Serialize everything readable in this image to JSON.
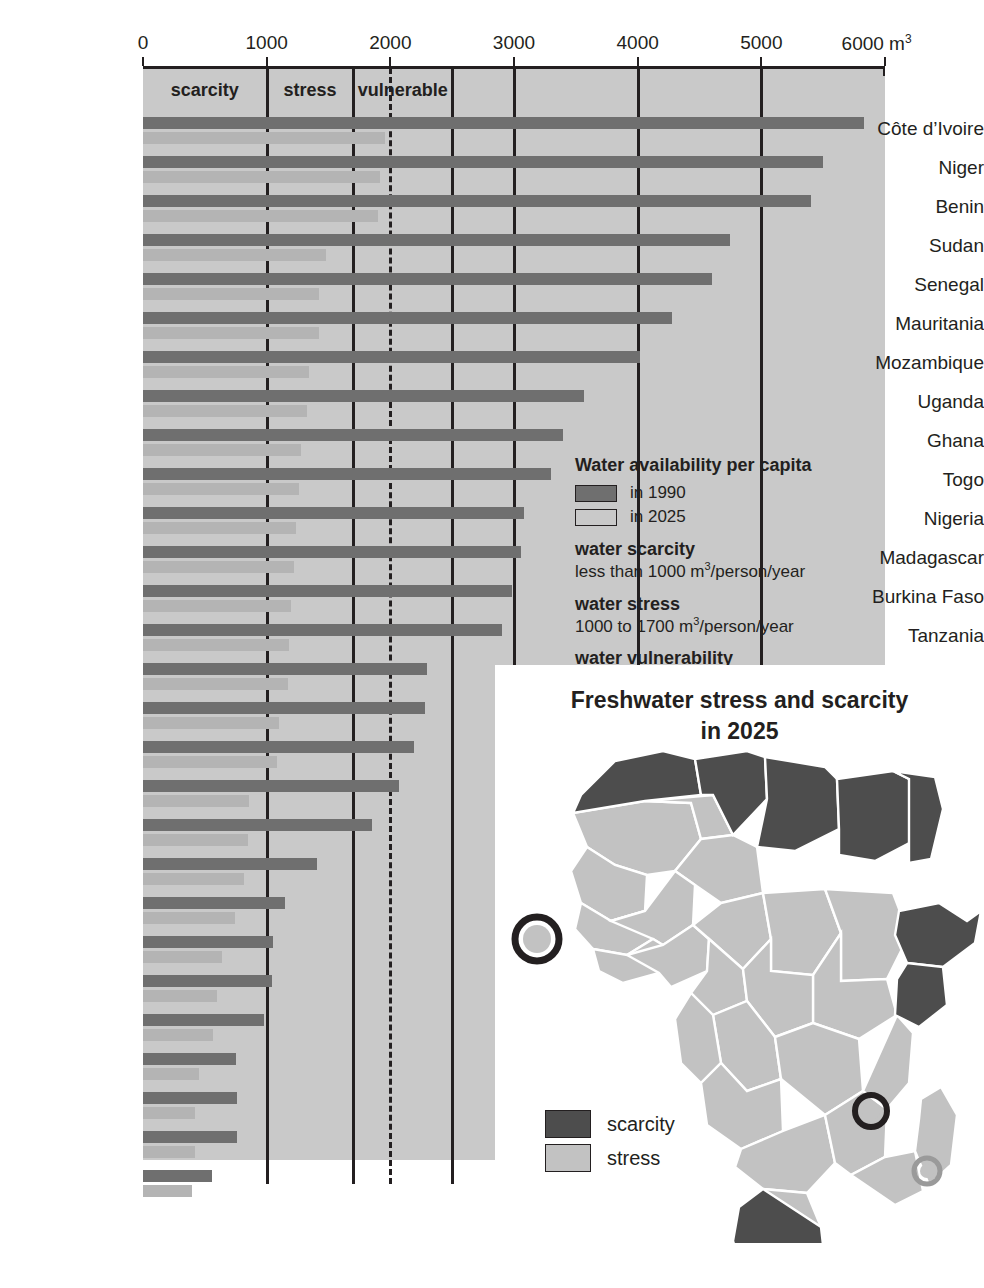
{
  "axis": {
    "ticks": [
      0,
      1000,
      2000,
      3000,
      4000,
      5000,
      6000
    ],
    "tick_labels": [
      "0",
      "1000",
      "2000",
      "3000",
      "4000",
      "5000",
      "6000"
    ],
    "unit_label": "m",
    "unit_sup": "3",
    "max": 6000,
    "min": 0
  },
  "bands": [
    {
      "label": "scarcity",
      "from": 0,
      "to": 1000
    },
    {
      "label": "stress",
      "from": 1000,
      "to": 1700
    },
    {
      "label": "vulnerable",
      "from": 1700,
      "to": 2500
    }
  ],
  "band_dividers": [
    1000,
    1700,
    2500
  ],
  "dotted_divider": 2000,
  "legend": {
    "title": "Water availability per capita",
    "series": [
      {
        "label": "in 1990",
        "color": "#6f6f6f"
      },
      {
        "label": "in 2025",
        "color": "#c9c9c9"
      }
    ],
    "definitions": [
      {
        "head": "water scarcity",
        "body_pre": "less than 1000 m",
        "body_sup": "3",
        "body_post": "/person/year"
      },
      {
        "head": "water stress",
        "body_pre": "1000 to 1700 m",
        "body_sup": "3",
        "body_post": "/person/year"
      },
      {
        "head": "water vulnerability",
        "body_pre": "1700 to 2500 m",
        "body_sup": "3",
        "body_post": "/person/year"
      }
    ]
  },
  "map": {
    "title_line1": "Freshwater stress and scarcity",
    "title_line2": "in 2025",
    "legend": [
      {
        "label": "scarcity",
        "color": "#4d4d4d"
      },
      {
        "label": "stress",
        "color": "#c2c2c2"
      }
    ]
  },
  "chart_data": {
    "type": "bar",
    "orientation": "horizontal",
    "title": "Water availability per capita",
    "xlabel": "m3 per person per year",
    "ylabel": "",
    "xlim": [
      0,
      6000
    ],
    "grid": true,
    "legend_position": "inside-right",
    "categories": [
      "Côte d’Ivoire",
      "Niger",
      "Benin",
      "Sudan",
      "Senegal",
      "Mauritania",
      "Mozambique",
      "Uganda",
      "Ghana",
      "Togo",
      "Nigeria",
      "Madagascar",
      "Burkina Faso",
      "Tanzania",
      "Zimbabwe",
      "Ethiopia",
      "Lesotho",
      "Mauritius",
      "Comoros",
      "South Africa",
      "Egypt",
      "Somalia",
      "Malawi",
      "Rwanda",
      "Burundi",
      "Kenya",
      "Cape Verde",
      "Djibouti"
    ],
    "series": [
      {
        "name": "in 1990",
        "color": "#6f6f6f",
        "values": [
          5830,
          5500,
          5400,
          4750,
          4600,
          4280,
          4020,
          3570,
          3400,
          3300,
          3080,
          3060,
          2980,
          2900,
          2300,
          2280,
          2190,
          2070,
          1850,
          1410,
          1150,
          1050,
          1040,
          980,
          750,
          760,
          760,
          560
        ]
      },
      {
        "name": "in 2025",
        "color": "#b4b4b4",
        "values": [
          1960,
          1920,
          1900,
          1480,
          1420,
          1420,
          1340,
          1330,
          1280,
          1260,
          1240,
          1220,
          1200,
          1180,
          1170,
          1100,
          1080,
          860,
          850,
          820,
          740,
          640,
          600,
          570,
          450,
          420,
          420,
          400
        ]
      }
    ]
  }
}
